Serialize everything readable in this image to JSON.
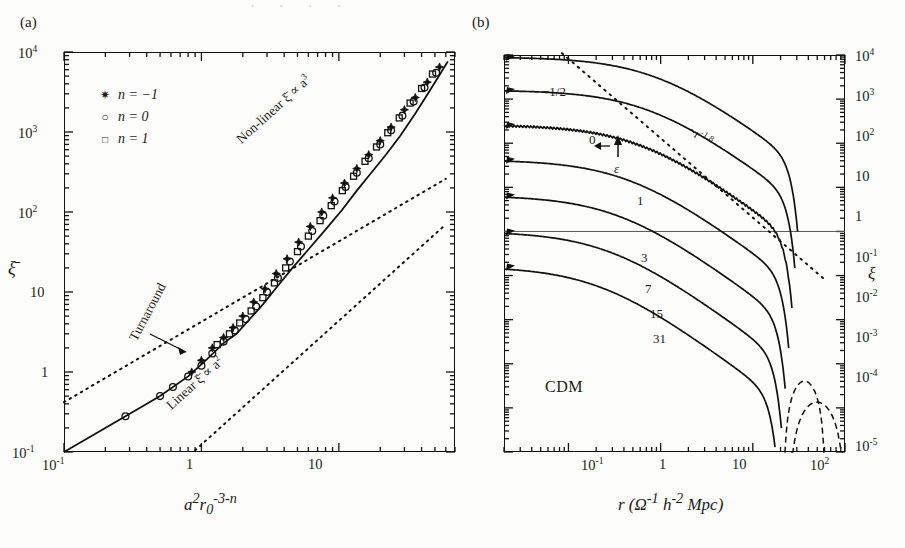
{
  "figure": {
    "header_bleed": "· ·   · ·",
    "width": 905,
    "height": 548
  },
  "panel_a": {
    "tag": "(a)",
    "xlabel_html": "a²r₀⁻³⁻ⁿ",
    "ylabel": "ξ̄",
    "xticks": [
      "10⁻¹",
      "1",
      "10"
    ],
    "yticks": [
      "10⁴",
      "10³",
      "10²",
      "10",
      "1",
      "10⁻¹"
    ],
    "legend": [
      {
        "symbol": "star",
        "label": "n = −1"
      },
      {
        "symbol": "circle",
        "label": "n = 0"
      },
      {
        "symbol": "square",
        "label": "n = 1"
      }
    ],
    "annotations": [
      {
        "name": "non-linear-label",
        "text": "Non-linear  ξ̄ ∝ a³"
      },
      {
        "name": "linear-label",
        "text": "Linear  ξ̄ ∝ a²"
      },
      {
        "name": "turnaround-label",
        "text": "Turnaround"
      }
    ]
  },
  "panel_b": {
    "tag": "(b)",
    "xlabel_html": "r (Ω⁻¹ h⁻² Mpc)",
    "ylabel": "ξ",
    "xticks": [
      "10⁻¹",
      "1",
      "10",
      "10²"
    ],
    "yticks": [
      "10⁴",
      "10³",
      "10²",
      "10",
      "1",
      "10⁻¹",
      "10⁻²",
      "10⁻³",
      "10⁻⁴",
      "10⁻⁵"
    ],
    "model_label": "CDM",
    "curve_labels": [
      "−1/2",
      "0",
      "1",
      "3",
      "7",
      "15",
      "31"
    ],
    "epsilon_label": "ε",
    "slope_label": "~r⁻¹·⁸"
  },
  "chart_data": [
    {
      "type": "scatter",
      "panel": "(a)",
      "title": "",
      "xlabel": "a^2 r_0^(-3-n)",
      "ylabel": "xi-bar",
      "xlim": [
        0.1,
        70
      ],
      "ylim": [
        0.1,
        10000
      ],
      "xscale": "log",
      "yscale": "log",
      "grid": false,
      "legend_position": "upper-left",
      "series": [
        {
          "name": "n = -1",
          "marker": "star",
          "x": [
            0.85,
            1.0,
            1.2,
            1.45,
            1.7,
            2.0,
            2.4,
            2.9,
            3.5,
            4.2,
            5.1,
            6.2,
            7.5,
            9.0,
            11.0,
            13.5,
            16.5,
            20.0,
            24.0,
            30.0,
            36.0,
            44.0,
            54.0
          ],
          "y": [
            1.0,
            1.4,
            2.0,
            2.7,
            3.6,
            5.0,
            7.5,
            11.0,
            17.0,
            26.0,
            42.0,
            66.0,
            100.0,
            150.0,
            230.0,
            350.0,
            520.0,
            780.0,
            1150.0,
            1900.0,
            2700.0,
            4200.0,
            6500.0
          ]
        },
        {
          "name": "n = 0",
          "marker": "circle",
          "x": [
            0.28,
            0.5,
            0.62,
            0.8,
            1.0,
            1.2,
            1.45,
            1.75,
            2.1,
            2.5,
            3.0,
            3.6,
            4.4,
            5.3,
            6.4,
            7.7,
            9.3,
            11.2,
            13.5,
            16.5,
            20.0,
            24.0,
            29.0,
            35.0,
            42.0,
            51.0
          ],
          "y": [
            0.28,
            0.5,
            0.65,
            0.88,
            1.2,
            1.7,
            2.4,
            3.3,
            4.6,
            6.6,
            10.0,
            15.0,
            24.0,
            37.0,
            58.0,
            90.0,
            135.0,
            205.0,
            310.0,
            470.0,
            700.0,
            1050.0,
            1600.0,
            2400.0,
            3600.0,
            5500.0
          ]
        },
        {
          "name": "n = 1",
          "marker": "square",
          "x": [
            1.3,
            1.6,
            1.9,
            2.3,
            2.8,
            3.4,
            4.1,
            5.0,
            6.0,
            7.3,
            8.8,
            10.6,
            12.8,
            15.5,
            18.8,
            22.7,
            27.5,
            33.0,
            40.0,
            48.0
          ],
          "y": [
            2.2,
            3.0,
            4.1,
            5.8,
            8.5,
            13.0,
            20.0,
            32.0,
            50.0,
            78.0,
            120.0,
            185.0,
            280.0,
            430.0,
            650.0,
            980.0,
            1500.0,
            2300.0,
            3500.0,
            5300.0
          ]
        }
      ],
      "reference_lines": [
        {
          "name": "Linear xi-bar ∝ a^2",
          "style": "dotted",
          "slope_loglog": 1.0,
          "through": [
            0.1,
            0.42
          ],
          "note": "lower dotted guide"
        },
        {
          "name": "Non-linear xi-bar ∝ a^3",
          "style": "dotted",
          "slope_loglog": 1.0,
          "through": [
            0.1,
            0.42
          ],
          "note": "upper dotted guide"
        },
        {
          "name": "fit curve",
          "style": "solid",
          "note": "traces the data points"
        }
      ],
      "annotations": [
        {
          "text": "Non-linear ξ̄ ∝ a³",
          "at": [
            9,
            2000
          ]
        },
        {
          "text": "Linear ξ̄ ∝ a²",
          "at": [
            1.6,
            0.6
          ]
        },
        {
          "text": "Turnaround",
          "at": [
            1.3,
            4
          ],
          "arrow_to": [
            1.9,
            3.0
          ]
        }
      ]
    },
    {
      "type": "line",
      "panel": "(b)",
      "title": "CDM",
      "xlabel": "r (Ω⁻¹ h⁻² Mpc)",
      "ylabel": "ξ",
      "xlim": [
        0.02,
        100
      ],
      "ylim": [
        1e-05,
        10000
      ],
      "xscale": "log",
      "yscale": "log",
      "grid": false,
      "legend_position": "inline-curve-labels",
      "series": [
        {
          "name": "−1/2",
          "z_or_epsilon": -0.5,
          "anchor_left_y": 9000,
          "knee_r": 0.9,
          "cutoff_r": 30
        },
        {
          "name": "0",
          "z_or_epsilon": 0,
          "anchor_left_y": 1600,
          "knee_r": 0.75,
          "cutoff_r": 28
        },
        {
          "name": "1",
          "z_or_epsilon": 1,
          "anchor_left_y": 260,
          "knee_r": 0.6,
          "cutoff_r": 26
        },
        {
          "name": "3",
          "z_or_epsilon": 3,
          "anchor_left_y": 42,
          "knee_r": 0.45,
          "cutoff_r": 24
        },
        {
          "name": "7",
          "z_or_epsilon": 7,
          "anchor_left_y": 6.5,
          "knee_r": 0.35,
          "cutoff_r": 22
        },
        {
          "name": "15",
          "z_or_epsilon": 15,
          "anchor_left_y": 1.0,
          "knee_r": 0.28,
          "cutoff_r": 20
        },
        {
          "name": "31",
          "z_or_epsilon": 31,
          "anchor_left_y": 0.16,
          "knee_r": 0.22,
          "cutoff_r": 18
        }
      ],
      "reference_lines": [
        {
          "name": "~r^-1.8",
          "style": "dotted",
          "slope_loglog": -1.8,
          "through": [
            0.1,
            9000
          ]
        },
        {
          "name": "xi = 1",
          "style": "thin-solid-horizontal",
          "y": 1
        }
      ],
      "dashed_features": [
        {
          "name": "anti-correlation bump 1",
          "r_range": [
            22,
            60
          ],
          "peak_y": 0.0004
        },
        {
          "name": "anti-correlation bump 2",
          "r_range": [
            26,
            95
          ],
          "peak_y": 0.00013
        }
      ],
      "annotations": [
        {
          "text": "ε",
          "arrow": "up",
          "at": [
            0.55,
            10
          ]
        },
        {
          "text": "CDM",
          "at": [
            0.25,
            0.0002
          ]
        }
      ]
    }
  ]
}
